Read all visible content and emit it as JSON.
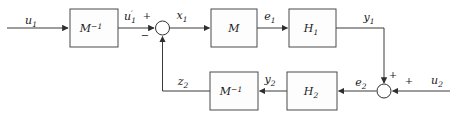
{
  "colors": {
    "background": "#ffffff",
    "wire": "#3a3a3a",
    "block_border": "#4a4a4a",
    "text": "#1a1a1a"
  },
  "blocks": [
    {
      "id": "m-inverse-top",
      "base": "M",
      "sup": "−1",
      "sub": ""
    },
    {
      "id": "m",
      "base": "M",
      "sup": "",
      "sub": ""
    },
    {
      "id": "h1",
      "base": "H",
      "sup": "",
      "sub": "1"
    },
    {
      "id": "m-inverse-bottom",
      "base": "M",
      "sup": "−1",
      "sub": ""
    },
    {
      "id": "h2",
      "base": "H",
      "sup": "",
      "sub": "2"
    }
  ],
  "signals": {
    "u1": {
      "base": "u",
      "sub": "1"
    },
    "u1_prime": {
      "base": "u",
      "prime": "′",
      "sub": "1"
    },
    "x1": {
      "base": "x",
      "sub": "1"
    },
    "e1": {
      "base": "e",
      "sub": "1"
    },
    "y1": {
      "base": "y",
      "sub": "1"
    },
    "z2": {
      "base": "z",
      "sub": "2"
    },
    "y2": {
      "base": "y",
      "sub": "2"
    },
    "e2": {
      "base": "e",
      "sub": "2"
    },
    "u2": {
      "base": "u",
      "sub": "2"
    }
  },
  "signs": {
    "sum1_plus": "+",
    "sum1_minus": "−",
    "sum2_plus_top": "+",
    "sum2_plus_right": "+"
  }
}
